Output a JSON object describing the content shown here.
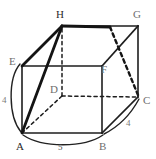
{
  "figure": {
    "type": "geometry-diagram",
    "shape_name": "rectangular prism",
    "background_color": "#ffffff",
    "line_color": "#1d1d1d",
    "faint_line_color": "#555555",
    "vertices": [
      {
        "id": "A",
        "label": "A",
        "x": 22,
        "y": 133,
        "label_x": 16,
        "label_y": 141
      },
      {
        "id": "B",
        "label": "B",
        "x": 102,
        "y": 133,
        "label_x": 99,
        "label_y": 141
      },
      {
        "id": "C",
        "label": "C",
        "x": 138,
        "y": 97,
        "label_x": 143,
        "label_y": 95
      },
      {
        "id": "D",
        "label": "D",
        "x": 62,
        "y": 96,
        "label_x": 50,
        "label_y": 84
      },
      {
        "id": "E",
        "label": "E",
        "x": 22,
        "y": 66,
        "label_x": 9,
        "label_y": 56
      },
      {
        "id": "F",
        "label": "F",
        "x": 102,
        "y": 66,
        "label_x": 101,
        "label_y": 64
      },
      {
        "id": "G",
        "label": "G",
        "x": 138,
        "y": 26,
        "label_x": 133,
        "label_y": 9
      },
      {
        "id": "H",
        "label": "H",
        "x": 62,
        "y": 26,
        "label_x": 56,
        "label_y": 9
      }
    ],
    "dimensions": [
      {
        "id": "height-left",
        "label": "4",
        "edge": "A-E",
        "x": 2,
        "y": 97
      },
      {
        "id": "width-bottom",
        "label": "5",
        "edge": "A-B",
        "x": 58,
        "y": 144
      },
      {
        "id": "depth-right",
        "label": "4",
        "edge": "B-C",
        "x": 126,
        "y": 120
      }
    ],
    "solid_edges": [
      {
        "from": "A",
        "to": "B"
      },
      {
        "from": "B",
        "to": "F"
      },
      {
        "from": "F",
        "to": "E"
      },
      {
        "from": "E",
        "to": "A"
      },
      {
        "from": "E",
        "to": "H"
      },
      {
        "from": "H",
        "to": "G"
      },
      {
        "from": "G",
        "to": "F"
      },
      {
        "from": "G",
        "to": "C"
      },
      {
        "from": "C",
        "to": "B"
      }
    ],
    "dashed_edges": [
      {
        "from": "A",
        "to": "D"
      },
      {
        "from": "D",
        "to": "C"
      },
      {
        "from": "D",
        "to": "H"
      },
      {
        "from": "H",
        "to": "C"
      }
    ],
    "bold_edges": [
      {
        "from": "A",
        "to": "H"
      },
      {
        "from": "E",
        "to": "H"
      }
    ],
    "arcs": [
      {
        "id": "arc-left",
        "from": "E",
        "to": "A",
        "label": "4"
      },
      {
        "id": "arc-bottom",
        "from": "A",
        "to": "B",
        "label": "5"
      },
      {
        "id": "arc-right",
        "from": "B",
        "to": "C",
        "label": "4"
      }
    ]
  }
}
